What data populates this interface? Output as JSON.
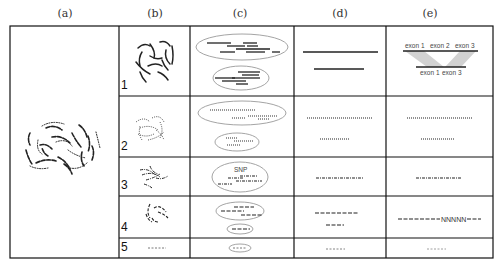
{
  "figure": {
    "column_headers": [
      "(a)",
      "(b)",
      "(c)",
      "(d)",
      "(e)"
    ],
    "row_numbers": [
      "1",
      "2",
      "3",
      "4",
      "5"
    ],
    "annotations": {
      "snp_label": "SNP",
      "exon_top": [
        "exon 1",
        "exon 2",
        "exon 3"
      ],
      "exon_bottom": [
        "exon 1",
        "exon 3"
      ],
      "gap_label": "NNNNN"
    },
    "colors": {
      "border": "#111111",
      "ellipse": "#9a9a9a",
      "read": "#222222",
      "splice_shade": "#d2d2d2"
    }
  }
}
